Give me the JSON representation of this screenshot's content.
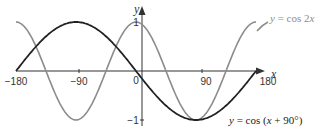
{
  "chart_data": {
    "type": "line",
    "title": "",
    "xlabel": "x",
    "ylabel": "y",
    "xlim": [
      -180,
      180
    ],
    "ylim": [
      -1,
      1
    ],
    "x_ticks": [
      "-180",
      "-90",
      "0",
      "90",
      "180"
    ],
    "y_ticks": [
      "1",
      "-1"
    ],
    "grid": false,
    "series": [
      {
        "name": "y = cos 2x",
        "color": "#8c8c8c",
        "x": [
          -180,
          -135,
          -90,
          -45,
          0,
          45,
          90,
          135,
          180
        ],
        "values": [
          1,
          0,
          -1,
          0,
          1,
          0,
          -1,
          0,
          1
        ]
      },
      {
        "name": "y = cos (x + 90°)",
        "color": "#222222",
        "x": [
          -180,
          -135,
          -90,
          -45,
          0,
          45,
          90,
          135,
          180
        ],
        "values": [
          0,
          0.707,
          1,
          0.707,
          0,
          -0.707,
          -1,
          -0.707,
          0
        ]
      }
    ],
    "annotations": [
      "y = cos 2x",
      "y = cos (x + 90°)"
    ]
  },
  "labels": {
    "x_axis": "x",
    "y_axis": "y",
    "origin": "0",
    "tick_neg180": "−180",
    "tick_neg90": "−90",
    "tick_90": "90",
    "tick_180": "180",
    "tick_y1": "1",
    "tick_yneg1": "−1",
    "cos2x_y": "y",
    "cos2x_rest": " = cos 2",
    "cos2x_x": "x",
    "shift_y": "y",
    "shift_mid": " = cos (",
    "shift_x": "x",
    "shift_end": " + 90°)"
  }
}
